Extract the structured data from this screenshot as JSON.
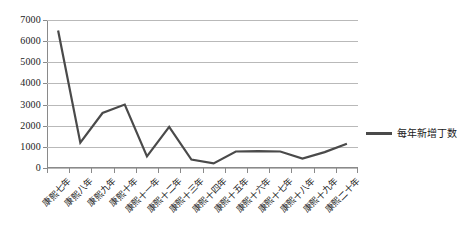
{
  "chart_data": {
    "type": "line",
    "title": "",
    "xlabel": "",
    "ylabel": "",
    "ylim": [
      0,
      7000
    ],
    "ytick_step": 1000,
    "grid": true,
    "legend_position": "right",
    "line_color": "#4a4a4a",
    "categories": [
      "康熙七年",
      "康熙八年",
      "康熙九年",
      "康熙十年",
      "康熙十一年",
      "康熙十二年",
      "康熙十三年",
      "康熙十四年",
      "康熙十五年",
      "康熙十六年",
      "康熙十七年",
      "康熙十八年",
      "康熙十九年",
      "康熙二十年"
    ],
    "series": [
      {
        "name": "每年新增丁数",
        "values": [
          6500,
          1200,
          2600,
          3000,
          550,
          1950,
          400,
          220,
          780,
          800,
          780,
          450,
          750,
          1150
        ]
      }
    ],
    "ytick_labels": [
      "7000",
      "6000",
      "5000",
      "4000",
      "3000",
      "2000",
      "1000",
      "0"
    ]
  },
  "legend": {
    "label": "每年新增丁数"
  }
}
